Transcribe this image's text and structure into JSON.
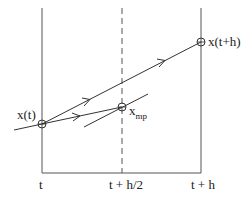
{
  "diagram": {
    "axis_labels": {
      "left": "t",
      "middle": "t + h/2",
      "right": "t + h"
    },
    "points": {
      "start": "x(t)",
      "midpoint_base": "x",
      "midpoint_sub": "mp",
      "end": "x(t+h)"
    },
    "colors": {
      "line": "#333333",
      "background": "#ffffff"
    }
  }
}
